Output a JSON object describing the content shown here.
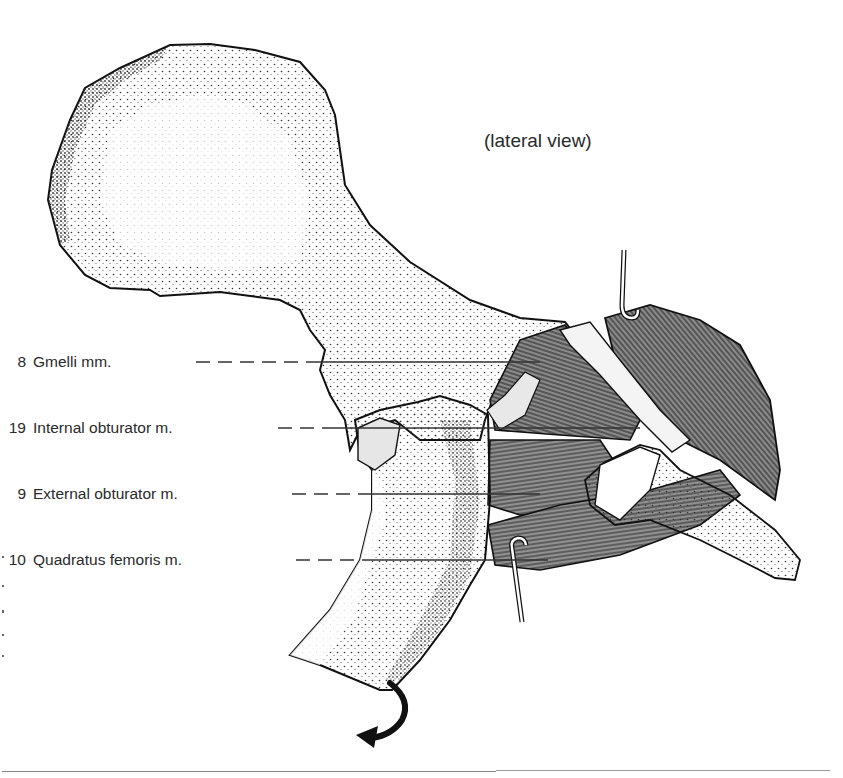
{
  "figure": {
    "caption": "(lateral view)",
    "labels": [
      {
        "number": "8",
        "text": "Gmelli mm.",
        "y": 366
      },
      {
        "number": "19",
        "text": "Internal obturator m.",
        "y": 432
      },
      {
        "number": "9",
        "text": "External obturator m.",
        "y": 495
      },
      {
        "number": "10",
        "text": "Quadratus femoris m.",
        "y": 560
      }
    ],
    "rotation_arrow": "curved-arrow (external rotation of femur)",
    "colors": {
      "ink": "#1a1a1a",
      "muscle_fill": "#6f6f6f",
      "bone_fill": "#ffffff",
      "label_text": "#2a2a2a",
      "rule": "#888888"
    }
  }
}
